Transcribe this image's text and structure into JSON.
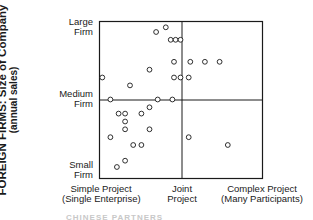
{
  "chart_data": {
    "type": "scatter",
    "title": "",
    "ylabel": "FOREIGN FIRMS: Size of Company",
    "ylabel_sub": "(annual sales)",
    "xlabel": "",
    "y_ticks": [
      {
        "label_line1": "Large",
        "label_line2": "Firm",
        "position": "top"
      },
      {
        "label_line1": "Medium",
        "label_line2": "Firm",
        "position": "middle"
      },
      {
        "label_line1": "Small",
        "label_line2": "Firm",
        "position": "bottom"
      }
    ],
    "x_ticks": [
      {
        "label_line1": "Simple Project",
        "label_line2": "(Single Enterprise)",
        "position": "left"
      },
      {
        "label_line1": "Joint",
        "label_line2": "Project",
        "position": "middle"
      },
      {
        "label_line1": "Complex Project",
        "label_line2": "(Many Participants)",
        "position": "right"
      }
    ],
    "grid": "quadrant lines at x=0.5 and y=0.5",
    "xlim": [
      0,
      1
    ],
    "ylim": [
      0,
      1
    ],
    "marker": "open circle",
    "points": [
      {
        "x": 0.35,
        "y": 0.93
      },
      {
        "x": 0.41,
        "y": 0.96
      },
      {
        "x": 0.44,
        "y": 0.88
      },
      {
        "x": 0.47,
        "y": 0.88
      },
      {
        "x": 0.5,
        "y": 0.88
      },
      {
        "x": 0.46,
        "y": 0.74
      },
      {
        "x": 0.56,
        "y": 0.74
      },
      {
        "x": 0.65,
        "y": 0.74
      },
      {
        "x": 0.74,
        "y": 0.74
      },
      {
        "x": 0.31,
        "y": 0.69
      },
      {
        "x": 0.46,
        "y": 0.64
      },
      {
        "x": 0.5,
        "y": 0.64
      },
      {
        "x": 0.55,
        "y": 0.64
      },
      {
        "x": 0.02,
        "y": 0.64
      },
      {
        "x": 0.19,
        "y": 0.59
      },
      {
        "x": 0.07,
        "y": 0.5
      },
      {
        "x": 0.36,
        "y": 0.5
      },
      {
        "x": 0.45,
        "y": 0.5
      },
      {
        "x": 0.31,
        "y": 0.45
      },
      {
        "x": 0.12,
        "y": 0.41
      },
      {
        "x": 0.16,
        "y": 0.41
      },
      {
        "x": 0.26,
        "y": 0.41
      },
      {
        "x": 0.16,
        "y": 0.36
      },
      {
        "x": 0.16,
        "y": 0.31
      },
      {
        "x": 0.31,
        "y": 0.31
      },
      {
        "x": 0.07,
        "y": 0.26
      },
      {
        "x": 0.55,
        "y": 0.26
      },
      {
        "x": 0.79,
        "y": 0.21
      },
      {
        "x": 0.21,
        "y": 0.21
      },
      {
        "x": 0.26,
        "y": 0.21
      },
      {
        "x": 0.16,
        "y": 0.11
      },
      {
        "x": 0.11,
        "y": 0.07
      }
    ]
  },
  "labels": {
    "ylabel_main": "FOREIGN FIRMS: Size of Company",
    "ylabel_sub": "(annual sales)",
    "y_large_1": "Large",
    "y_large_2": "Firm",
    "y_medium_1": "Medium",
    "y_medium_2": "Firm",
    "y_small_1": "Small",
    "y_small_2": "Firm",
    "x_simple_1": "Simple Project",
    "x_simple_2": "(Single Enterprise)",
    "x_joint_1": "Joint",
    "x_joint_2": "Project",
    "x_complex_1": "Complex Project",
    "x_complex_2": "(Many Participants)",
    "footer_cut": "CHINESE PARTNERS"
  },
  "colors": {
    "ink": "#1a1a1a",
    "background": "#ffffff"
  }
}
